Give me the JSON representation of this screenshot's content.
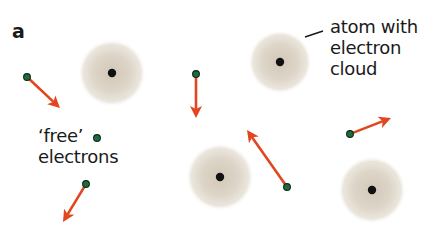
{
  "figure": {
    "panel_label": "a",
    "annotations": {
      "atom_label": [
        "atom with",
        "electron",
        "cloud"
      ],
      "free_label": [
        "‘free’",
        "electrons"
      ]
    },
    "colors": {
      "background": "#ffffff",
      "cloud_center": "#d8d0c2",
      "cloud_edge": "#efeae2",
      "nucleus": "#111111",
      "electron_fill": "#1f6b3f",
      "electron_stroke": "#0d2a19",
      "arrow": "#e2461f",
      "text": "#1a1a1a"
    },
    "atoms": [
      {
        "cx": 112,
        "cy": 73,
        "r": 34
      },
      {
        "cx": 280,
        "cy": 62,
        "r": 32
      },
      {
        "cx": 220,
        "cy": 177,
        "r": 34
      },
      {
        "cx": 372,
        "cy": 190,
        "r": 34
      }
    ],
    "electrons": [
      {
        "x": 27,
        "y": 77,
        "arrow_to": [
          60,
          108
        ]
      },
      {
        "x": 196,
        "y": 74,
        "arrow_to": [
          196,
          118
        ]
      },
      {
        "x": 97,
        "y": 138,
        "arrow_to": null
      },
      {
        "x": 86,
        "y": 184,
        "arrow_to": [
          63,
          222
        ]
      },
      {
        "x": 287,
        "y": 187,
        "arrow_to": [
          247,
          130
        ]
      },
      {
        "x": 350,
        "y": 134,
        "arrow_to": [
          391,
          118
        ]
      }
    ],
    "callout_line": {
      "x1": 305,
      "y1": 37,
      "x2": 323,
      "y2": 31
    }
  }
}
